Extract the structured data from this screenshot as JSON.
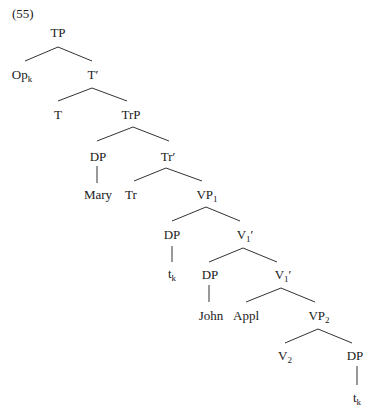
{
  "example_number": "(55)",
  "tree": {
    "line_color": "#333333",
    "nodes": [
      {
        "id": "TP",
        "label": "TP",
        "sub": "",
        "prime": "",
        "x": 58,
        "y": 26
      },
      {
        "id": "Op",
        "label": "Op",
        "sub": "k",
        "prime": "",
        "x": 22,
        "y": 68
      },
      {
        "id": "T1",
        "label": "T",
        "sub": "",
        "prime": "′",
        "x": 93,
        "y": 68
      },
      {
        "id": "T",
        "label": "T",
        "sub": "",
        "prime": "",
        "x": 58,
        "y": 108
      },
      {
        "id": "TrP",
        "label": "TrP",
        "sub": "",
        "prime": "",
        "x": 131,
        "y": 108
      },
      {
        "id": "DP1",
        "label": "DP",
        "sub": "",
        "prime": "",
        "x": 98,
        "y": 150
      },
      {
        "id": "Tr1",
        "label": "Tr",
        "sub": "",
        "prime": "′",
        "x": 168,
        "y": 150
      },
      {
        "id": "Mary",
        "label": "Mary",
        "sub": "",
        "prime": "",
        "x": 98,
        "y": 188
      },
      {
        "id": "Tr",
        "label": "Tr",
        "sub": "",
        "prime": "",
        "x": 131,
        "y": 188
      },
      {
        "id": "VP1",
        "label": "VP",
        "sub": "1",
        "prime": "",
        "x": 207,
        "y": 188
      },
      {
        "id": "DP2",
        "label": "DP",
        "sub": "",
        "prime": "",
        "x": 172,
        "y": 228
      },
      {
        "id": "V1a",
        "label": "V",
        "sub": "1",
        "prime": "′",
        "x": 245,
        "y": 228
      },
      {
        "id": "tk1",
        "label": "t",
        "sub": "k",
        "prime": "",
        "x": 172,
        "y": 267
      },
      {
        "id": "DP3",
        "label": "DP",
        "sub": "",
        "prime": "",
        "x": 210,
        "y": 268
      },
      {
        "id": "V1b",
        "label": "V",
        "sub": "1",
        "prime": "′",
        "x": 283,
        "y": 268
      },
      {
        "id": "John",
        "label": "John",
        "sub": "",
        "prime": "",
        "x": 211,
        "y": 309
      },
      {
        "id": "Appl",
        "label": "Appl",
        "sub": "",
        "prime": "",
        "x": 246,
        "y": 309
      },
      {
        "id": "VP2",
        "label": "VP",
        "sub": "2",
        "prime": "",
        "x": 319,
        "y": 309
      },
      {
        "id": "V2",
        "label": "V",
        "sub": "2",
        "prime": "",
        "x": 285,
        "y": 349
      },
      {
        "id": "DP4",
        "label": "DP",
        "sub": "",
        "prime": "",
        "x": 355,
        "y": 349
      },
      {
        "id": "tk2",
        "label": "t",
        "sub": "k",
        "prime": "",
        "x": 357,
        "y": 391
      }
    ],
    "edges": [
      [
        58,
        47,
        25,
        61
      ],
      [
        58,
        47,
        92,
        61
      ],
      [
        92,
        88,
        58,
        101
      ],
      [
        92,
        88,
        127,
        101
      ],
      [
        133,
        127,
        97,
        141
      ],
      [
        133,
        127,
        169,
        141
      ],
      [
        97,
        166,
        97,
        183
      ],
      [
        166,
        168,
        134,
        181
      ],
      [
        166,
        168,
        202,
        181
      ],
      [
        206,
        207,
        172,
        221
      ],
      [
        206,
        207,
        240,
        221
      ],
      [
        172,
        246,
        172,
        262
      ],
      [
        243,
        248,
        209,
        262
      ],
      [
        243,
        248,
        277,
        262
      ],
      [
        209,
        285,
        209,
        302
      ],
      [
        281,
        288,
        246,
        302
      ],
      [
        281,
        288,
        315,
        302
      ],
      [
        318,
        329,
        285,
        343
      ],
      [
        318,
        329,
        352,
        343
      ],
      [
        357,
        366,
        357,
        385
      ]
    ]
  }
}
